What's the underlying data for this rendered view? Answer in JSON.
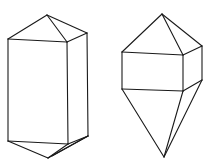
{
  "figure": {
    "stroke_color": "#1a1a1a",
    "background": "#ffffff"
  },
  "crystals": [
    {
      "name": "prismatic-crystal",
      "shape": "hexagonal prism with pyramidal terminations",
      "edges": [
        [
          47,
          15,
          8,
          39
        ],
        [
          47,
          15,
          67,
          42
        ],
        [
          47,
          15,
          87,
          33
        ],
        [
          8,
          39,
          67,
          42
        ],
        [
          67,
          42,
          87,
          33
        ],
        [
          8,
          39,
          8,
          141
        ],
        [
          67,
          42,
          68,
          144
        ],
        [
          87,
          33,
          88,
          136
        ],
        [
          8,
          141,
          68,
          144
        ],
        [
          68,
          144,
          88,
          136
        ],
        [
          8,
          141,
          48,
          158
        ],
        [
          68,
          144,
          48,
          158
        ],
        [
          88,
          136,
          48,
          158
        ],
        [
          88,
          136,
          52,
          156
        ]
      ]
    },
    {
      "name": "bipyramidal-crystal",
      "shape": "short prism with elongated pyramidal terminations",
      "edges": [
        [
          162,
          14,
          122,
          52
        ],
        [
          162,
          14,
          183,
          55
        ],
        [
          162,
          14,
          202,
          46
        ],
        [
          122,
          52,
          183,
          55
        ],
        [
          183,
          55,
          202,
          46
        ],
        [
          122,
          52,
          122,
          89
        ],
        [
          183,
          55,
          183,
          91
        ],
        [
          202,
          46,
          202,
          80
        ],
        [
          122,
          89,
          183,
          91
        ],
        [
          183,
          91,
          202,
          80
        ],
        [
          122,
          89,
          164,
          157
        ],
        [
          183,
          91,
          164,
          157
        ],
        [
          202,
          80,
          164,
          157
        ]
      ]
    }
  ]
}
